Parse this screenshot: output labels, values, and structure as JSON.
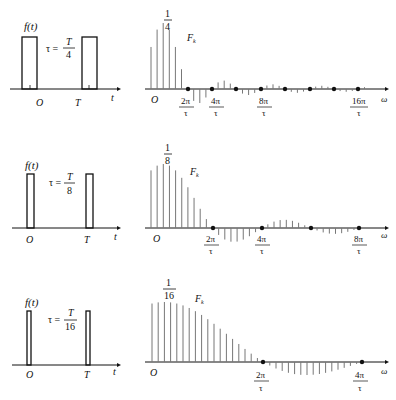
{
  "rows": [
    {
      "time_plot": {
        "ylabel": "f(t)",
        "tau_label": "τ =",
        "tau_num": "T",
        "tau_den": "4",
        "origin_label": "O",
        "period_label": "T",
        "xlabel": "t"
      },
      "spectrum": {
        "peak_num": "1",
        "peak_den": "4",
        "series_label": "F",
        "series_sub": "k",
        "origin_label": "O",
        "xlabel": "ω",
        "ticks": [
          {
            "num": "2π",
            "den": "τ"
          },
          {
            "num": "4π",
            "den": "τ"
          },
          {
            "num": "8π",
            "den": "τ"
          },
          {
            "num": "16π",
            "den": "τ"
          }
        ]
      }
    },
    {
      "time_plot": {
        "ylabel": "f(t)",
        "tau_label": "τ =",
        "tau_num": "T",
        "tau_den": "8",
        "origin_label": "O",
        "period_label": "T",
        "xlabel": "t"
      },
      "spectrum": {
        "peak_num": "1",
        "peak_den": "8",
        "series_label": "F",
        "series_sub": "k",
        "origin_label": "O",
        "xlabel": "ω",
        "ticks": [
          {
            "num": "2π",
            "den": "τ"
          },
          {
            "num": "4π",
            "den": "τ"
          },
          {
            "num": "8π",
            "den": "τ"
          }
        ]
      }
    },
    {
      "time_plot": {
        "ylabel": "f(t)",
        "tau_label": "τ =",
        "tau_num": "T",
        "tau_den": "16",
        "origin_label": "O",
        "period_label": "T",
        "xlabel": "t"
      },
      "spectrum": {
        "peak_num": "1",
        "peak_den": "16",
        "series_label": "F",
        "series_sub": "k",
        "origin_label": "O",
        "xlabel": "ω",
        "ticks": [
          {
            "num": "2π",
            "den": "τ"
          },
          {
            "num": "4π",
            "den": "τ"
          }
        ]
      }
    }
  ],
  "colors": {
    "line": "#111111",
    "stem": "#7a7a7a"
  }
}
